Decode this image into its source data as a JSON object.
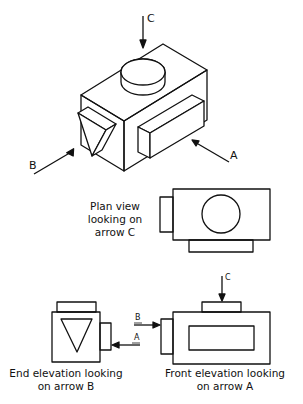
{
  "isometric": {
    "arrows": [
      {
        "label": "C",
        "direction": "down"
      },
      {
        "label": "B",
        "direction": "up-right"
      },
      {
        "label": "A",
        "direction": "up-left"
      }
    ]
  },
  "views": {
    "plan": {
      "caption_line1": "Plan view",
      "caption_line2": "looking on",
      "caption_line3": "arrow C"
    },
    "end": {
      "caption_line1": "End elevation looking",
      "caption_line2": "on arrow B",
      "arrow_b": "B",
      "arrow_a": "A"
    },
    "front": {
      "caption_line1": "Front elevation looking",
      "caption_line2": "on arrow A",
      "arrow_c": "C"
    }
  },
  "colors": {
    "stroke": "#111111",
    "background": "#ffffff"
  }
}
